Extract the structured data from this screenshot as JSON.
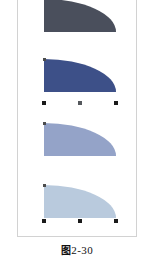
{
  "figure": {
    "caption_cn": "图",
    "caption_number": "2-30",
    "caption_full": "图2-30",
    "frame_border_color": "#d2d2d2",
    "background_color": "#ffffff"
  },
  "shapes": [
    {
      "index": 1,
      "name": "quarter-ellipse-dark-slate",
      "fill": "#4a4f5c",
      "border": "#3e424e",
      "selected": false,
      "x": 26,
      "y": 0,
      "width": 72,
      "height": 33,
      "label": "Shape 1 dark slate quarter ellipse"
    },
    {
      "index": 2,
      "name": "quarter-ellipse-navy",
      "fill": "#3d5088",
      "border": "#31416f",
      "selected": true,
      "x": 26,
      "y": 60,
      "width": 72,
      "height": 33,
      "label": "Shape 2 navy quarter ellipse"
    },
    {
      "index": 3,
      "name": "quarter-ellipse-steel-blue",
      "fill": "#94a3c8",
      "border": "#7f90ba",
      "selected": false,
      "x": 26,
      "y": 124,
      "width": 72,
      "height": 33,
      "label": "Shape 3 steel blue quarter ellipse"
    },
    {
      "index": 4,
      "name": "quarter-ellipse-pale-blue",
      "fill": "#b9cadd",
      "border": "#a6b9cf",
      "selected": true,
      "x": 26,
      "y": 186,
      "width": 72,
      "height": 33,
      "label": "Shape 4 pale blue quarter ellipse"
    }
  ],
  "selection_handles": {
    "shape2": [
      {
        "name": "handle-bottom-left",
        "x": 24,
        "y": 102
      },
      {
        "name": "handle-bottom-center",
        "x": 60,
        "y": 102
      },
      {
        "name": "handle-bottom-right",
        "x": 96,
        "y": 102
      },
      {
        "name": "handle-rotate-top-left",
        "x": 25,
        "y": 59
      }
    ],
    "shape3": [
      {
        "name": "handle-rotate-top-left",
        "x": 25,
        "y": 123
      }
    ],
    "shape4": [
      {
        "name": "handle-bottom-left",
        "x": 24,
        "y": 220
      },
      {
        "name": "handle-bottom-center",
        "x": 60,
        "y": 220
      },
      {
        "name": "handle-bottom-right",
        "x": 96,
        "y": 220
      },
      {
        "name": "handle-rotate-top-left",
        "x": 25,
        "y": 185
      }
    ]
  }
}
